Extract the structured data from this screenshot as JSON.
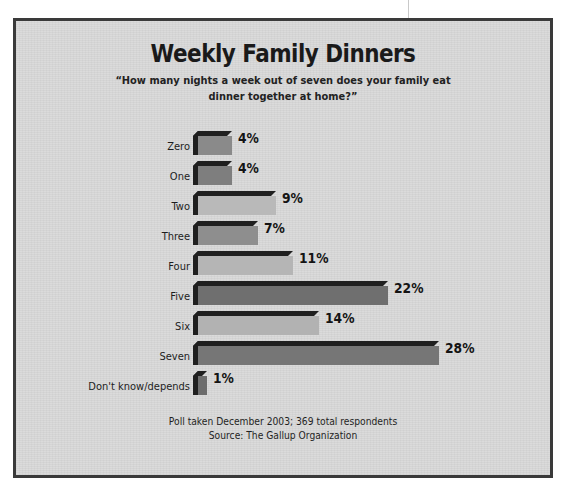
{
  "chart_data": {
    "type": "bar",
    "orientation": "horizontal",
    "title": "Weekly Family Dinners",
    "subtitle": "“How many nights a week out of seven does your family eat dinner together at home?”",
    "categories": [
      "Zero",
      "One",
      "Two",
      "Three",
      "Four",
      "Five",
      "Six",
      "Seven",
      "Don't know/depends"
    ],
    "values": [
      4,
      4,
      9,
      7,
      11,
      22,
      14,
      28,
      1
    ],
    "value_labels": [
      "4%",
      "4%",
      "9%",
      "7%",
      "11%",
      "22%",
      "14%",
      "28%",
      "1%"
    ],
    "bar_colors": [
      "#8a8a8a",
      "#7e7e7e",
      "#b9b9b9",
      "#8e8e8e",
      "#b5b5b5",
      "#6f6f6f",
      "#b2b2b2",
      "#767676",
      "#6d6d6d"
    ],
    "xlabel": "",
    "ylabel": "",
    "xlim": [
      0,
      28
    ],
    "grid": false,
    "legend": "none",
    "footnote_line1": "Poll taken December 2003; 369 total respondents",
    "footnote_line2": "Source: The Gallup Organization"
  },
  "style": {
    "background": "#d9d9d9",
    "frame_color": "#3a3a3a",
    "text_color": "#1a1a1a",
    "bar_shadow_color": "#1f1f1f"
  }
}
